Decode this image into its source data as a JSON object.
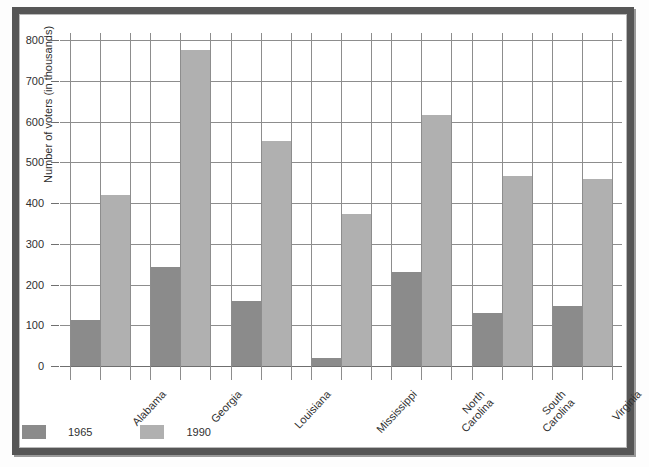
{
  "figure": {
    "background_color": "#ffffff",
    "frame_color": "#565656"
  },
  "axis": {
    "ylabel": "Number of voters (in thousands)",
    "yticks": [
      "0",
      "100",
      "200",
      "300",
      "400",
      "500",
      "600",
      "700",
      "800"
    ]
  },
  "legend": {
    "items": [
      {
        "label": "1965",
        "color": "#8b8b8b"
      },
      {
        "label": "1990",
        "color": "#b0b0b0"
      }
    ]
  },
  "chart_data": {
    "type": "bar",
    "title": "",
    "xlabel": "",
    "ylabel": "Number of voters (in thousands)",
    "ylim": [
      0,
      830
    ],
    "yticks": [
      0,
      100,
      200,
      300,
      400,
      500,
      600,
      700,
      800
    ],
    "grid": true,
    "legend_position": "below-left",
    "categories": [
      "Alabama",
      "Georgia",
      "Louisiana",
      "Mississippi",
      "North\nCarolina",
      "South\nCarolina",
      "Virginia"
    ],
    "series": [
      {
        "name": "1965",
        "color": "#8b8b8b",
        "values": [
          113,
          243,
          160,
          20,
          230,
          130,
          148
        ]
      },
      {
        "name": "1990",
        "color": "#b0b0b0",
        "values": [
          420,
          775,
          553,
          373,
          617,
          466,
          458
        ]
      }
    ]
  }
}
